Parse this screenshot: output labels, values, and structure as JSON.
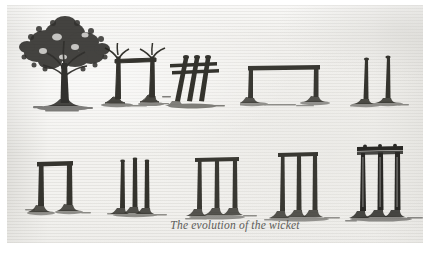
{
  "page": {
    "kind": "scanned-book-page",
    "caption": "The evolution of the wicket",
    "paper_color": "#f2f1ee",
    "ink_color": "#2b2a28",
    "margin_color": "#ffffff"
  },
  "figures": {
    "row_top": [
      {
        "id": "stage-1",
        "name": "tree",
        "label": "tree",
        "description": "A full leafy tree with broad dark canopy and a single trunk, standing on a patch of ground."
      },
      {
        "id": "stage-2",
        "name": "two-forked-stumps-with-bar",
        "label": "two forked stumps with bar",
        "description": "Two cut tree stumps with forked tops supporting a single long horizontal bar between them."
      },
      {
        "id": "stage-3",
        "name": "three-slanted-stumps-two-bails",
        "label": "three slanted stumps with two bails",
        "description": "Three slanted rough stumps crossed by two horizontal bails."
      },
      {
        "id": "stage-4",
        "name": "wide-two-stump-wicket",
        "label": "wide low two-stump wicket",
        "description": "Two short stumps set far apart carrying one very long straight bail."
      },
      {
        "id": "stage-5",
        "name": "two-tall-stumps",
        "label": "two tall stumps",
        "description": "Two tall slender stumps standing close together with no bail."
      }
    ],
    "row_bottom": [
      {
        "id": "stage-6",
        "name": "two-stump-wicket-with-bail",
        "label": "two-stump wicket with bail",
        "description": "Two upright stumps of moderate height joined by a single bail across the top."
      },
      {
        "id": "stage-7",
        "name": "three-stumps-no-bail",
        "label": "three stumps, no bail",
        "description": "Three narrow stumps standing close together without bails."
      },
      {
        "id": "stage-8",
        "name": "three-stump-wicket-single-bail",
        "label": "three-stump wicket with single bail",
        "description": "Three tall stumps joined by one long bail laid across the top."
      },
      {
        "id": "stage-9",
        "name": "taller-three-stump-wicket",
        "label": "taller three-stump wicket",
        "description": "Three taller stumps with a long bail across the top, narrower spacing."
      },
      {
        "id": "stage-10",
        "name": "modern-three-stump-wicket-two-bails",
        "label": "modern three-stump wicket with two bails",
        "description": "The modern wicket: three tall stumps topped by two grooved bails."
      }
    ]
  }
}
